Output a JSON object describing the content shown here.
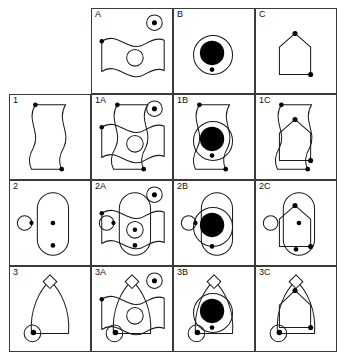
{
  "figure": {
    "type": "matrix-reasoning-puzzle",
    "title": "",
    "grid": {
      "columns": 4,
      "rows": 4,
      "cell_width": 82,
      "cell_height": 86
    },
    "column_headers": [
      "",
      "A",
      "B",
      "C"
    ],
    "row_headers": [
      "",
      "1",
      "2",
      "3"
    ],
    "ink_color": "#1a1a1a",
    "border_color": "#3a3a3a",
    "background_color": "#ffffff"
  },
  "cells": [
    {
      "id": "r0c0",
      "label": "",
      "bordered": false,
      "shapes": []
    },
    {
      "id": "r0c1",
      "label": "A",
      "bordered": true,
      "shapes": [
        "wavy-horizontal-band",
        "inner-small-circle",
        "left-edge-dot",
        "corner-circle-with-dot"
      ]
    },
    {
      "id": "r0c2",
      "label": "B",
      "bordered": true,
      "shapes": [
        "outline-circle",
        "large-filled-circle",
        "bottom-dot"
      ]
    },
    {
      "id": "r0c3",
      "label": "C",
      "bordered": true,
      "shapes": [
        "house-pentagon",
        "apex-dot",
        "bottom-right-dot"
      ]
    },
    {
      "id": "r1c0",
      "label": "1",
      "bordered": true,
      "shapes": [
        "wavy-vertical-band",
        "top-dot",
        "bottom-dot"
      ]
    },
    {
      "id": "r1c1",
      "label": "1A",
      "bordered": true,
      "shapes": [
        "wavy-vertical-band",
        "wavy-horizontal-band",
        "inner-small-circle",
        "corner-circle-with-dot",
        "dots"
      ]
    },
    {
      "id": "r1c2",
      "label": "1B",
      "bordered": true,
      "shapes": [
        "wavy-vertical-band",
        "outline-circle",
        "large-filled-circle",
        "dots"
      ]
    },
    {
      "id": "r1c3",
      "label": "1C",
      "bordered": true,
      "shapes": [
        "wavy-vertical-band",
        "house-pentagon",
        "dots"
      ]
    },
    {
      "id": "r2c0",
      "label": "2",
      "bordered": true,
      "shapes": [
        "capsule",
        "side-circle-with-dot",
        "center-dot",
        "lower-dot"
      ]
    },
    {
      "id": "r2c1",
      "label": "2A",
      "bordered": true,
      "shapes": [
        "capsule",
        "wavy-horizontal-band",
        "inner-small-circle-with-dot",
        "side-circle-with-dot",
        "corner-circle-with-dot",
        "lower-dot"
      ]
    },
    {
      "id": "r2c2",
      "label": "2B",
      "bordered": true,
      "shapes": [
        "capsule",
        "outline-circle",
        "large-filled-circle",
        "side-circle-with-dot",
        "lower-dot"
      ]
    },
    {
      "id": "r2c3",
      "label": "2C",
      "bordered": true,
      "shapes": [
        "capsule",
        "house-pentagon",
        "side-circle",
        "center-dot",
        "lower-dot",
        "apex-dot"
      ]
    },
    {
      "id": "r3c0",
      "label": "3",
      "bordered": true,
      "shapes": [
        "pointed-arch",
        "diamond-notch",
        "corner-circle-with-filled-dot"
      ]
    },
    {
      "id": "r3c1",
      "label": "3A",
      "bordered": true,
      "shapes": [
        "pointed-arch",
        "diamond-notch",
        "wavy-horizontal-band",
        "inner-small-circle",
        "corner-circle-with-dot",
        "corner-circle-with-filled-dot"
      ]
    },
    {
      "id": "r3c2",
      "label": "3B",
      "bordered": true,
      "shapes": [
        "pointed-arch",
        "diamond-notch",
        "outline-circle",
        "large-filled-circle",
        "corner-circle-with-filled-dot",
        "dot"
      ]
    },
    {
      "id": "r3c3",
      "label": "3C",
      "bordered": true,
      "shapes": [
        "pointed-arch",
        "diamond-notch",
        "house-pentagon",
        "corner-circle-with-filled-dot",
        "apex-dot",
        "lower-right-dot"
      ]
    }
  ]
}
